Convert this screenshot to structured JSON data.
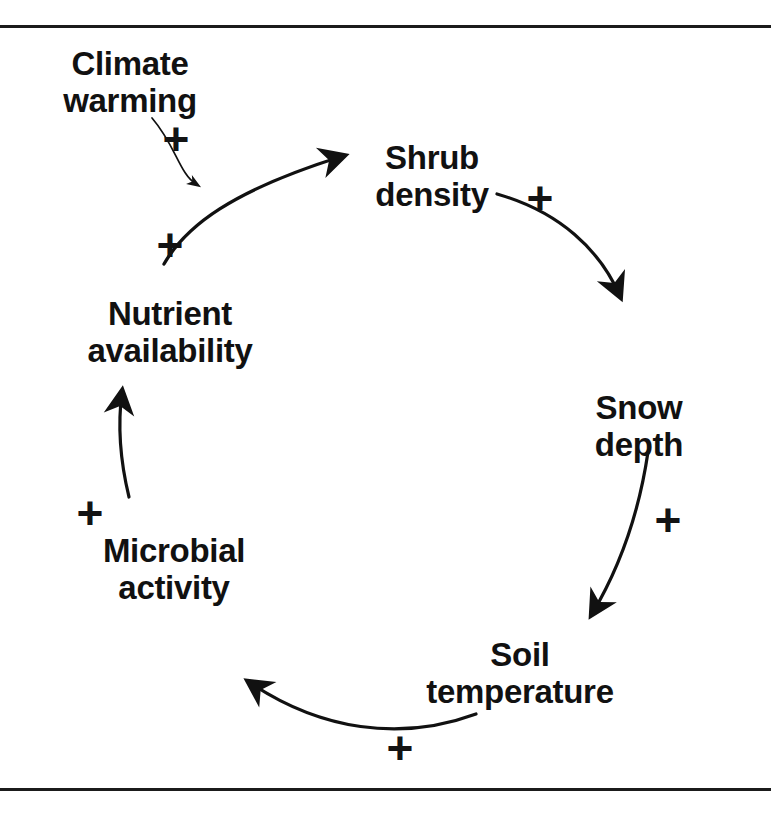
{
  "figure": {
    "kind": "causal-loop-diagram",
    "background_color": "#ffffff",
    "ink_color": "#111111",
    "border_rules": [
      {
        "name": "top-rule",
        "y": 25
      },
      {
        "name": "bottom-rule",
        "y": 788
      }
    ]
  },
  "nodes": [
    {
      "id": "climate-warming",
      "label": "Climate\nwarming",
      "line1": "Climate",
      "line2": "warming",
      "x": 128,
      "y": 46,
      "role": "external-driver"
    },
    {
      "id": "shrub-density",
      "label": "Shrub\ndensity",
      "line1": "Shrub",
      "line2": "density",
      "x": 432,
      "y": 140,
      "role": "loop-node"
    },
    {
      "id": "snow-depth",
      "label": "Snow\ndepth",
      "line1": "Snow",
      "line2": "depth",
      "x": 639,
      "y": 390,
      "role": "loop-node"
    },
    {
      "id": "soil-temperature",
      "label": "Soil\ntemperature",
      "line1": "Soil",
      "line2": "temperature",
      "x": 519,
      "y": 637,
      "role": "loop-node"
    },
    {
      "id": "microbial-activity",
      "label": "Microbial\nactivity",
      "line1": "Microbial",
      "line2": "activity",
      "x": 173,
      "y": 533,
      "role": "loop-node"
    },
    {
      "id": "nutrient-availability",
      "label": "Nutrient\navailability",
      "line1": "Nutrient",
      "line2": "availability",
      "x": 168,
      "y": 296,
      "role": "loop-node"
    }
  ],
  "links": [
    {
      "id": "climate-to-shrub",
      "from": "climate-warming",
      "to": "shrub-density",
      "sign": "+",
      "sign_x": 176,
      "sign_y": 141,
      "stroke_width": 1.6,
      "style": "thin-curve"
    },
    {
      "id": "nutrient-to-shrub",
      "from": "nutrient-availability",
      "to": "shrub-density",
      "sign": "+",
      "sign_x": 170,
      "sign_y": 247,
      "stroke_width": 3.2,
      "style": "arc"
    },
    {
      "id": "shrub-to-snow",
      "from": "shrub-density",
      "to": "snow-depth",
      "sign": "+",
      "sign_x": 540,
      "sign_y": 200,
      "stroke_width": 3.2,
      "style": "arc"
    },
    {
      "id": "snow-to-soil",
      "from": "snow-depth",
      "to": "soil-temperature",
      "sign": "+",
      "sign_x": 668,
      "sign_y": 522,
      "stroke_width": 3.2,
      "style": "arc"
    },
    {
      "id": "soil-to-microbial",
      "from": "soil-temperature",
      "to": "microbial-activity",
      "sign": "+",
      "sign_x": 400,
      "sign_y": 750,
      "stroke_width": 3.2,
      "style": "arc"
    },
    {
      "id": "microbial-to-nutrient",
      "from": "microbial-activity",
      "to": "nutrient-availability",
      "sign": "+",
      "sign_x": 90,
      "sign_y": 515,
      "stroke_width": 3.2,
      "style": "arc"
    }
  ],
  "signs": {
    "plus": "+"
  }
}
